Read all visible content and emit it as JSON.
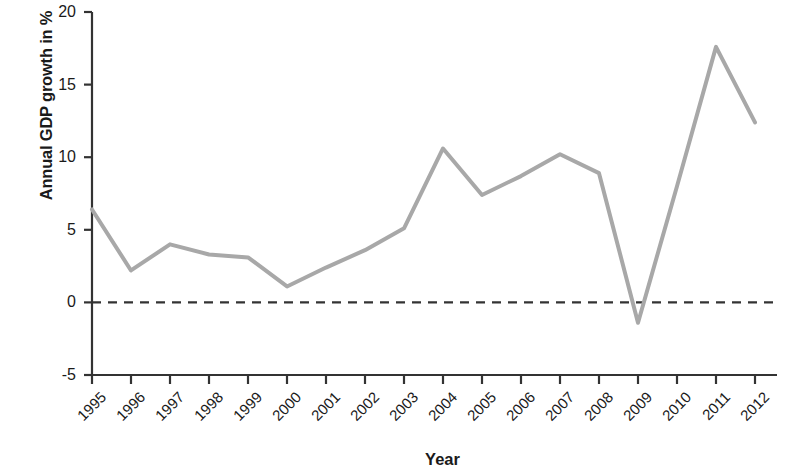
{
  "chart_data": {
    "type": "line",
    "title": "",
    "xlabel": "Year",
    "ylabel": "Annual GDP growth in %",
    "x": [
      1995,
      1996,
      1997,
      1998,
      1999,
      2000,
      2001,
      2002,
      2003,
      2004,
      2005,
      2006,
      2007,
      2008,
      2009,
      2010,
      2011,
      2012
    ],
    "categories": [
      "1995",
      "1996",
      "1997",
      "1998",
      "1999",
      "2000",
      "2001",
      "2002",
      "2003",
      "2004",
      "2005",
      "2006",
      "2007",
      "2008",
      "2009",
      "2010",
      "2011",
      "2012"
    ],
    "values": [
      6.4,
      2.2,
      4.0,
      3.3,
      3.1,
      1.1,
      2.4,
      3.6,
      5.1,
      10.6,
      7.4,
      8.7,
      10.2,
      8.9,
      -1.4,
      8.0,
      17.6,
      12.4
    ],
    "series": [
      {
        "name": "Annual GDP growth",
        "color": "#a8a8a8",
        "values": [
          6.4,
          2.2,
          4.0,
          3.3,
          3.1,
          1.1,
          2.4,
          3.6,
          5.1,
          10.6,
          7.4,
          8.7,
          10.2,
          8.9,
          -1.4,
          8.0,
          17.6,
          12.4
        ]
      }
    ],
    "ylim": [
      -5,
      20
    ],
    "yticks": [
      -5,
      0,
      5,
      10,
      15,
      20
    ],
    "ytick_labels": [
      "-5",
      "0",
      "5",
      "10",
      "15",
      "20"
    ],
    "xlim": [
      1995,
      2012
    ],
    "grid": false,
    "legend": "none",
    "reference_line": {
      "name": "zero-line",
      "value": 0,
      "style": "dashed",
      "color": "#333333"
    },
    "axis_color": "#333333",
    "line_color": "#a8a8a8",
    "line_width": 4
  },
  "axis": {
    "y_title": "Annual GDP growth in %",
    "x_title": "Year"
  }
}
